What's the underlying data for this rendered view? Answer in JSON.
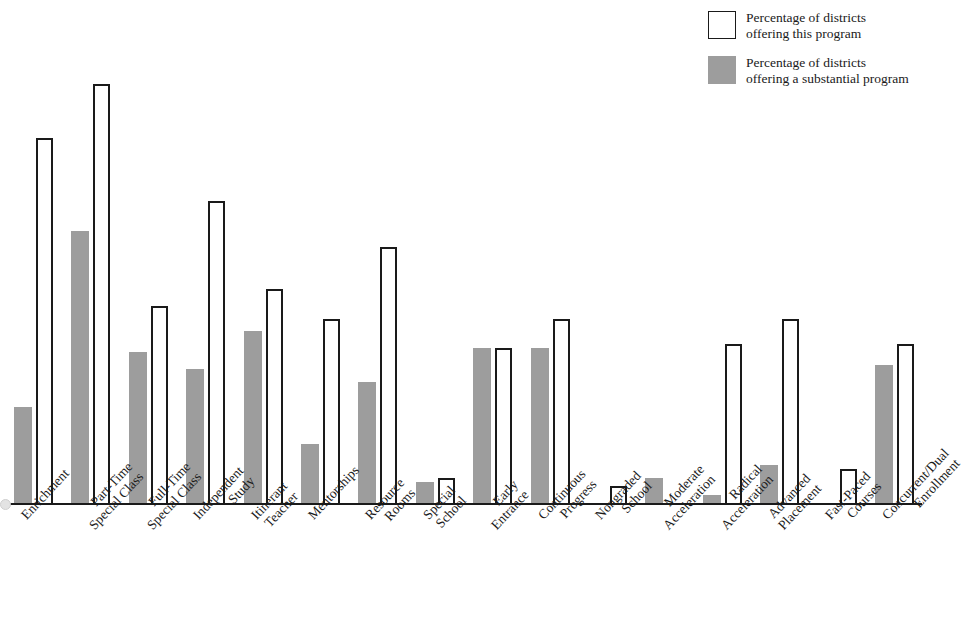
{
  "legend": {
    "items": [
      {
        "swatch": "open",
        "label": "Percentage of districts\noffering this program"
      },
      {
        "swatch": "filled",
        "label": "Percentage of districts\noffering a substantial program"
      }
    ]
  },
  "colors": {
    "filled": "#9d9d9d",
    "outline": "#1a1a1a",
    "background": "#ffffff"
  },
  "chart_data": {
    "type": "bar",
    "title": "",
    "xlabel": "",
    "ylabel": "",
    "ylim": [
      0,
      100
    ],
    "grid": false,
    "legend_position": "top-right",
    "categories": [
      "Enrichment",
      "Part-Time\nSpecial Class",
      "Full-Time\nSpecial Class",
      "Independent\nStudy",
      "Itinerant\nTeacher",
      "Mentorships",
      "Resource\nRooms",
      "Special\nSchool",
      "Early\nEntrance",
      "Continuous\nProgress",
      "Nongraded\nSchool",
      "Moderate\nAcceleration",
      "Radical\nAcceleration",
      "Advanced\nPlacement",
      "Fast-Paced\nCourses",
      "Concurrent/Dual\nEnrollment"
    ],
    "series": [
      {
        "name": "Percentage of districts offering a substantial program",
        "style": "filled",
        "values": [
          23,
          65,
          36,
          32,
          41,
          14,
          29,
          5,
          37,
          37,
          0,
          6,
          2,
          9,
          0,
          33
        ]
      },
      {
        "name": "Percentage of districts offering this program",
        "style": "open",
        "values": [
          87,
          100,
          47,
          72,
          51,
          44,
          61,
          6,
          37,
          44,
          4,
          0,
          38,
          44,
          8,
          38
        ]
      }
    ]
  },
  "axis": {
    "baseline_visible": true,
    "y_axis_visible": false,
    "tick_marks": false
  }
}
